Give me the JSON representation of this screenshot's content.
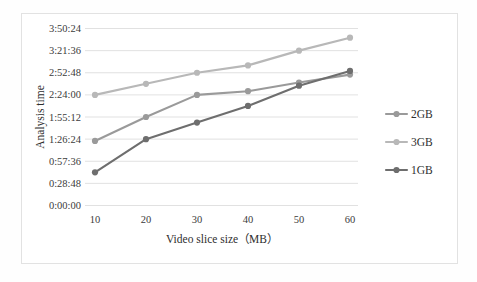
{
  "chart_data": {
    "type": "line",
    "title": "",
    "xlabel": "Video slice size（MB）",
    "ylabel": "Analysis time",
    "categories": [
      "10",
      "20",
      "30",
      "40",
      "50",
      "60"
    ],
    "x": [
      10,
      20,
      30,
      40,
      50,
      60
    ],
    "xlim": [
      10,
      60
    ],
    "ylim": [
      "0:00:00",
      "3:50:24"
    ],
    "y_tick_labels": [
      "3:50:24",
      "3:21:36",
      "2:52:48",
      "2:24:00",
      "1:55:12",
      "1:26:24",
      "0:57:36",
      "0:28:48",
      "0:00:00"
    ],
    "y_tick_seconds": [
      13824,
      12096,
      10368,
      8640,
      6912,
      5184,
      3456,
      1728,
      0
    ],
    "grid": true,
    "legend_position": "right",
    "series": [
      {
        "name": "2GB",
        "color": "#9a9a9a",
        "values": [
          "1:24:00",
          "1:55:12",
          "2:24:00",
          "2:28:48",
          "2:40:00",
          "2:50:24"
        ],
        "values_seconds": [
          5040,
          6912,
          8640,
          8928,
          9600,
          10224
        ]
      },
      {
        "name": "3GB",
        "color": "#b8b8b8",
        "values": [
          "2:24:00",
          "2:38:24",
          "2:52:48",
          "3:02:24",
          "3:21:36",
          "3:38:24"
        ],
        "values_seconds": [
          8640,
          9504,
          10368,
          10944,
          12096,
          13104
        ]
      },
      {
        "name": "1GB",
        "color": "#6e6e6e",
        "values": [
          "0:43:12",
          "1:26:24",
          "1:48:00",
          "2:09:36",
          "2:36:00",
          "2:55:12"
        ],
        "values_seconds": [
          2592,
          5184,
          6480,
          7776,
          9360,
          10512
        ]
      }
    ]
  },
  "axes": {
    "y_title": "Analysis time",
    "x_title": "Video slice size（MB）",
    "y_labels": {
      "t0": "3:50:24",
      "t1": "3:21:36",
      "t2": "2:52:48",
      "t3": "2:24:00",
      "t4": "1:55:12",
      "t5": "1:26:24",
      "t6": "0:57:36",
      "t7": "0:28:48",
      "t8": "0:00:00"
    },
    "x_labels": {
      "c0": "10",
      "c1": "20",
      "c2": "30",
      "c3": "40",
      "c4": "50",
      "c5": "60"
    }
  },
  "legend": {
    "items": [
      {
        "label": "2GB",
        "color": "#9a9a9a"
      },
      {
        "label": "3GB",
        "color": "#b8b8b8"
      },
      {
        "label": "1GB",
        "color": "#6e6e6e"
      }
    ],
    "entry0": "2GB",
    "entry1": "3GB",
    "entry2": "1GB"
  },
  "colors": {
    "series_2gb": "#9a9a9a",
    "series_3gb": "#b8b8b8",
    "series_1gb": "#6e6e6e",
    "gridline": "#d9d9d9",
    "text": "#3a3a3a",
    "background": "#ffffff",
    "frame": "#e2e2e2"
  }
}
